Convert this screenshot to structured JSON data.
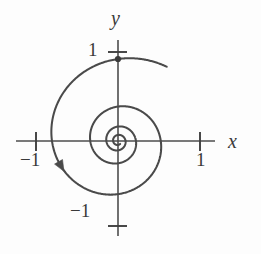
{
  "figure": {
    "name": "spiral-phase-portrait",
    "background_color": "#fdfdfd",
    "curve_color": "#4a4a4a",
    "axis_color": "#4d4d4d",
    "text_color": "#3a3a3a"
  },
  "axes": {
    "x_label": "x",
    "y_label": "y",
    "origin_px": {
      "x": 118,
      "y": 141
    },
    "unit_px": 82,
    "x_line_px": {
      "x1": 16,
      "y1": 141,
      "x2": 215,
      "y2": 141
    },
    "y_line_px": {
      "x1": 118,
      "y1": 40,
      "x2": 118,
      "y2": 236
    },
    "ticks": [
      {
        "name": "x-tick-negative-one",
        "label": "−1",
        "axis": "x",
        "value": -1,
        "px": {
          "x": 36,
          "y": 141
        }
      },
      {
        "name": "x-tick-positive-one",
        "label": "1",
        "axis": "x",
        "value": 1,
        "px": {
          "x": 200,
          "y": 141
        }
      },
      {
        "name": "y-tick-positive-one",
        "label": "1",
        "axis": "y",
        "value": 1,
        "px": {
          "x": 118,
          "y": 52
        }
      },
      {
        "name": "y-tick-negative-one",
        "label": "−1",
        "axis": "y",
        "value": -1,
        "px": {
          "x": 118,
          "y": 226
        }
      }
    ]
  },
  "chart_data": {
    "type": "line",
    "title": "",
    "subtitle": "",
    "xlabel": "x",
    "ylabel": "y",
    "xlim": [
      -1.25,
      1.18
    ],
    "ylim": [
      -1.24,
      1.24
    ],
    "grid": false,
    "legend": null,
    "curve_name": "decaying-clockwise-spiral",
    "start_point": {
      "x": 0,
      "y": 1,
      "marked": true
    },
    "end_point": {
      "x": 0,
      "y": 0
    },
    "direction": "clockwise-inward",
    "decay_per_turn": 0.42,
    "turns": 3.6,
    "axis_crossings": {
      "note": "approximate spiral radius at each successive axis crossing, in plot units",
      "positive_y": [
        1.0,
        0.8,
        0.52,
        0.35,
        0.2,
        0.11
      ],
      "negative_x": [
        1.0,
        0.67,
        0.41,
        0.22,
        0.1
      ],
      "negative_y": [
        0.92,
        0.58,
        0.33,
        0.16
      ],
      "positive_x": [
        1.0,
        0.73,
        0.41,
        0.23,
        0.11
      ]
    },
    "arrow": {
      "name": "direction-arrow",
      "at": {
        "x": -0.76,
        "y": -0.37
      },
      "points": "clockwise"
    },
    "tick_labels": {
      "x": [
        "−1",
        "1"
      ],
      "y": [
        "1",
        "−1"
      ]
    }
  }
}
